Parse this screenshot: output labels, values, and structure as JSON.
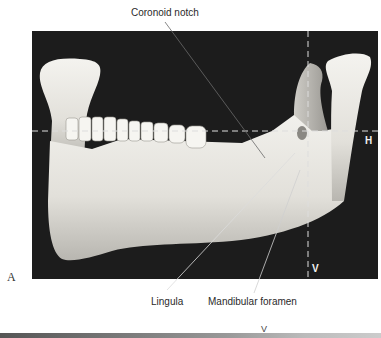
{
  "figure": {
    "panel_letter": "A",
    "labels": {
      "coronoid_notch": "Coronoid notch",
      "lingula": "Lingula",
      "mandibular_foramen": "Mandibular foramen"
    },
    "axes": {
      "horizontal": "H",
      "vertical": "V",
      "vertical_bottom_strip": "V"
    },
    "colors": {
      "photo_background": "#1c1c1c",
      "bone": "#e8e6e0",
      "leader_line": "#555555",
      "dashed_axis": "#dddddd"
    }
  }
}
